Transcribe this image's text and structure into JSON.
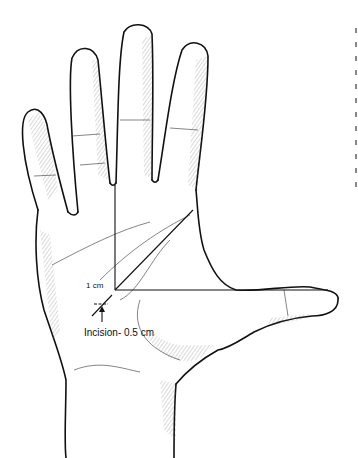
{
  "figure": {
    "labels": {
      "distance": "1 cm",
      "incision": "Incision- 0.5 cm"
    },
    "colors": {
      "background": "#ffffff",
      "line": "#111111",
      "hatching": "#555555"
    },
    "clipped_side_text_fragments": 12
  }
}
